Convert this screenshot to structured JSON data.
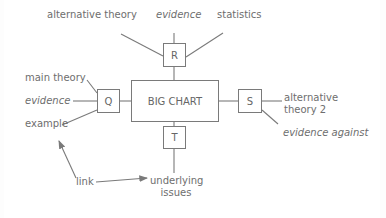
{
  "diagram": {
    "center": {
      "label": "BIG CHART"
    },
    "nodes": [
      {
        "id": "R",
        "label": "R",
        "position": "top"
      },
      {
        "id": "Q",
        "label": "Q",
        "position": "left"
      },
      {
        "id": "S",
        "label": "S",
        "position": "right"
      },
      {
        "id": "T",
        "label": "T",
        "position": "bottom"
      }
    ],
    "branches": {
      "R": [
        "alternative theory",
        "evidence",
        "statistics"
      ],
      "Q": [
        "main theory",
        "evidence",
        "example"
      ],
      "S": [
        "alternative theory 2",
        "evidence against"
      ],
      "T": [
        "underlying issues"
      ]
    },
    "labels": {
      "r_alt_theory": "alternative theory",
      "r_evidence": "evidence",
      "r_statistics": "statistics",
      "q_main_theory": "main theory",
      "q_evidence": "evidence",
      "q_example": "example",
      "s_alt_theory_line1": "alternative",
      "s_alt_theory_line2": "theory 2",
      "s_evidence_against": "evidence against",
      "t_underlying_line1": "underlying",
      "t_underlying_line2": "issues",
      "link": "link"
    },
    "annotation": {
      "label": "link",
      "arrows_to": [
        "example",
        "underlying issues"
      ]
    },
    "colors": {
      "line": "#7a7a7a",
      "text": "#6e6e6e",
      "background": "#ffffff"
    }
  }
}
